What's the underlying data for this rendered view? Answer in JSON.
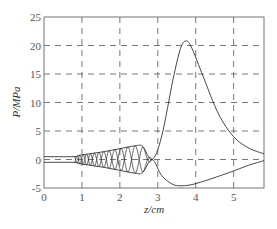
{
  "chart_data": {
    "type": "line",
    "title": "",
    "xlabel": "z/cm",
    "ylabel": "P/MPa",
    "xlim": [
      0,
      5.8
    ],
    "ylim": [
      -5,
      25
    ],
    "grid": "dashed",
    "legend": null,
    "x_ticks": [
      "0",
      "1",
      "2",
      "3",
      "4",
      "5"
    ],
    "y_ticks": [
      "-5",
      "0",
      "5",
      "10",
      "15",
      "20",
      "25"
    ],
    "series": [
      {
        "name": "upper envelope",
        "x": [
          0,
          0.8,
          0.9,
          1.2,
          1.6,
          2.0,
          2.4,
          2.6,
          2.85,
          3.1,
          3.4,
          3.6,
          3.75,
          3.9,
          4.2,
          4.6,
          5.0,
          5.4,
          5.8
        ],
        "values": [
          0.5,
          0.5,
          0.7,
          1.0,
          1.4,
          1.9,
          2.4,
          2.3,
          0.0,
          4.0,
          14.0,
          19.5,
          20.8,
          19.5,
          14.5,
          8.0,
          4.0,
          2.0,
          1.0
        ]
      },
      {
        "name": "lower envelope",
        "x": [
          0,
          0.8,
          0.9,
          1.2,
          1.6,
          2.0,
          2.4,
          2.6,
          2.85,
          3.1,
          3.35,
          3.55,
          3.9,
          4.4,
          5.0,
          5.4,
          5.8
        ],
        "values": [
          -0.5,
          -0.5,
          -0.7,
          -1.0,
          -1.4,
          -1.9,
          -2.4,
          -2.3,
          0.0,
          -2.8,
          -4.2,
          -4.6,
          -4.4,
          -3.4,
          -2.0,
          -1.0,
          -0.2
        ]
      }
    ]
  },
  "axes": {
    "xlabel": "z/cm",
    "ylabel": "P/MPa"
  }
}
